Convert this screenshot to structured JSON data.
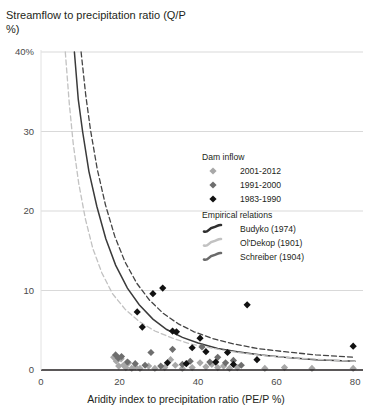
{
  "chart_data": {
    "type": "scatter",
    "title": "",
    "ylabel": "Streamflow to precipitation ratio (Q/P %)",
    "xlabel": "Aridity index to precipitation ratio (PE/P %)",
    "xlim": [
      0,
      82
    ],
    "ylim": [
      0,
      40
    ],
    "xticks": [
      0,
      20,
      40,
      60,
      80
    ],
    "xtick_labels": [
      "0",
      "20",
      "40",
      "60",
      "80"
    ],
    "yticks": [
      0,
      10,
      20,
      30,
      40
    ],
    "ytick_labels": [
      "0",
      "10",
      "20",
      "30",
      "40%"
    ],
    "grid": "horizontal",
    "legend_position": "right-middle",
    "series": [
      {
        "name": "2001-2012",
        "group": "Dam inflow",
        "marker": "diamond",
        "color": "#a8a8a8",
        "points": [
          [
            18.5,
            1.6
          ],
          [
            19.2,
            1.1
          ],
          [
            19.8,
            0.5
          ],
          [
            20.4,
            1.4
          ],
          [
            21.0,
            0.6
          ],
          [
            21.6,
            0.3
          ],
          [
            22.3,
            0.9
          ],
          [
            23.1,
            0.2
          ],
          [
            24.0,
            0.4
          ],
          [
            25.2,
            0.2
          ],
          [
            27.4,
            0.5
          ],
          [
            29.0,
            0.2
          ],
          [
            31.5,
            0.3
          ],
          [
            33.0,
            1.3
          ],
          [
            34.2,
            0.6
          ],
          [
            36.0,
            0.2
          ],
          [
            38.5,
            0.3
          ],
          [
            40.5,
            0.9
          ],
          [
            42.0,
            0.4
          ],
          [
            43.5,
            0.7
          ],
          [
            45.0,
            0.3
          ],
          [
            46.5,
            0.5
          ],
          [
            48.0,
            0.2
          ],
          [
            50.0,
            0.3
          ],
          [
            57.0,
            0.2
          ],
          [
            62.0,
            0.3
          ],
          [
            69.0,
            0.2
          ],
          [
            79.5,
            0.2
          ]
        ]
      },
      {
        "name": "1991-2000",
        "group": "Dam inflow",
        "marker": "diamond",
        "color": "#6e6e6e",
        "points": [
          [
            19.0,
            1.9
          ],
          [
            19.7,
            1.5
          ],
          [
            20.5,
            1.7
          ],
          [
            22.0,
            1.0
          ],
          [
            24.0,
            0.8
          ],
          [
            26.5,
            0.6
          ],
          [
            28.0,
            2.2
          ],
          [
            30.5,
            0.5
          ],
          [
            33.5,
            2.6
          ],
          [
            36.0,
            0.7
          ],
          [
            38.0,
            1.1
          ],
          [
            41.0,
            2.9
          ],
          [
            43.0,
            1.0
          ],
          [
            45.0,
            1.6
          ],
          [
            47.0,
            0.9
          ],
          [
            49.0,
            1.2
          ],
          [
            51.0,
            0.6
          ]
        ]
      },
      {
        "name": "1983-1990",
        "group": "Dam inflow",
        "marker": "diamond",
        "color": "#111111",
        "points": [
          [
            24.5,
            7.3
          ],
          [
            25.8,
            5.4
          ],
          [
            28.5,
            9.6
          ],
          [
            31.0,
            10.3
          ],
          [
            32.2,
            0.9
          ],
          [
            33.5,
            4.9
          ],
          [
            34.5,
            4.8
          ],
          [
            37.0,
            0.8
          ],
          [
            38.5,
            2.8
          ],
          [
            40.5,
            4.0
          ],
          [
            42.0,
            2.3
          ],
          [
            44.5,
            1.0
          ],
          [
            47.5,
            2.2
          ],
          [
            49.0,
            0.7
          ],
          [
            52.5,
            8.2
          ],
          [
            55.0,
            1.3
          ],
          [
            79.5,
            3.0
          ]
        ]
      }
    ],
    "curves": [
      {
        "name": "Budyko (1974)",
        "group": "Empirical relations",
        "color": "#3a3a3a",
        "style": "solid",
        "points": [
          [
            8.5,
            40.0
          ],
          [
            9.5,
            34.0
          ],
          [
            10.6,
            30.0
          ],
          [
            12.2,
            25.0
          ],
          [
            14.2,
            20.6
          ],
          [
            16.5,
            16.5
          ],
          [
            19.0,
            13.2
          ],
          [
            22.0,
            10.3
          ],
          [
            25.0,
            8.2
          ],
          [
            28.5,
            6.4
          ],
          [
            32.0,
            5.1
          ],
          [
            36.0,
            4.1
          ],
          [
            40.0,
            3.4
          ],
          [
            45.0,
            2.7
          ],
          [
            50.0,
            2.3
          ],
          [
            56.0,
            1.9
          ],
          [
            62.0,
            1.6
          ],
          [
            70.0,
            1.3
          ],
          [
            80.0,
            1.1
          ]
        ]
      },
      {
        "name": "Ol'Dekop (1901)",
        "group": "Empirical relations",
        "color": "#c2c2c2",
        "style": "dashed",
        "points": [
          [
            6.2,
            40.0
          ],
          [
            7.2,
            33.5
          ],
          [
            8.2,
            28.5
          ],
          [
            9.6,
            23.5
          ],
          [
            11.3,
            19.0
          ],
          [
            13.2,
            15.3
          ],
          [
            15.5,
            12.2
          ],
          [
            18.2,
            9.6
          ],
          [
            21.5,
            7.6
          ],
          [
            25.0,
            6.1
          ],
          [
            29.0,
            4.9
          ],
          [
            33.5,
            4.0
          ],
          [
            38.0,
            3.3
          ],
          [
            44.0,
            2.7
          ],
          [
            50.0,
            2.2
          ],
          [
            57.0,
            1.8
          ],
          [
            65.0,
            1.5
          ],
          [
            72.0,
            1.3
          ],
          [
            80.0,
            1.1
          ]
        ]
      },
      {
        "name": "Schreiber (1904)",
        "group": "Empirical relations",
        "color": "#444444",
        "style": "dashed",
        "points": [
          [
            10.2,
            40.0
          ],
          [
            11.4,
            34.5
          ],
          [
            12.6,
            30.2
          ],
          [
            14.3,
            25.3
          ],
          [
            16.4,
            20.8
          ],
          [
            18.8,
            16.8
          ],
          [
            21.4,
            13.6
          ],
          [
            24.4,
            10.9
          ],
          [
            27.6,
            8.8
          ],
          [
            31.2,
            7.1
          ],
          [
            35.0,
            5.8
          ],
          [
            39.0,
            4.8
          ],
          [
            44.0,
            3.9
          ],
          [
            49.0,
            3.3
          ],
          [
            55.0,
            2.7
          ],
          [
            62.0,
            2.3
          ],
          [
            70.0,
            1.9
          ],
          [
            80.0,
            1.6
          ]
        ]
      }
    ],
    "legend": {
      "groups": [
        {
          "heading": "Dam inflow",
          "entries": [
            {
              "label": "2001-2012",
              "swatch": "diamond",
              "color": "#a8a8a8"
            },
            {
              "label": "1991-2000",
              "swatch": "diamond",
              "color": "#6e6e6e"
            },
            {
              "label": "1983-1990",
              "swatch": "diamond",
              "color": "#111111"
            }
          ]
        },
        {
          "heading": "Empirical relations",
          "entries": [
            {
              "label": "Budyko (1974)",
              "swatch": "squiggle",
              "color": "#2f2f2f"
            },
            {
              "label": "Ol'Dekop (1901)",
              "swatch": "squiggle",
              "color": "#c2c2c2"
            },
            {
              "label": "Schreiber (1904)",
              "swatch": "squiggle",
              "color": "#6a6a6a"
            }
          ]
        }
      ]
    }
  },
  "colors": {
    "gridline": "#d9d9d9",
    "axis": "#231f20",
    "background": "#ffffff",
    "text": "#231f20"
  }
}
